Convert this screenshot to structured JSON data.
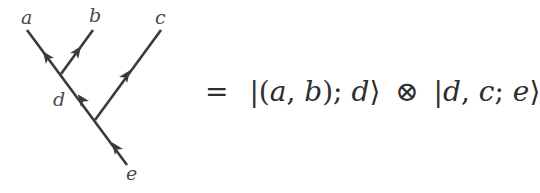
{
  "diagram": {
    "labels": {
      "a": "a",
      "b": "b",
      "c": "c",
      "d": "d",
      "e": "e"
    },
    "line_color": "#3a3a3a"
  },
  "equation": {
    "equals": "=",
    "ket1": {
      "open": "|(",
      "p1": "a",
      "comma1": ", ",
      "p2": "b",
      "close_paren": ");",
      "p3": "d",
      "close": "⟩"
    },
    "tensor": "⊗",
    "ket2": {
      "open": "|",
      "p1": "d",
      "comma1": ", ",
      "p2": "c",
      "semi": "; ",
      "p3": "e",
      "close": "⟩"
    }
  }
}
